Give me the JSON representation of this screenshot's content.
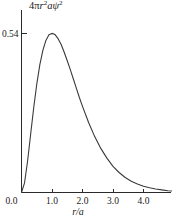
{
  "chart_data": {
    "type": "line",
    "title": "",
    "subtitle": "",
    "ylabel": "4πr²aψ²",
    "ylabel_parts": {
      "coefficient": "4",
      "pi": "π",
      "r": "r",
      "r_exp": "2",
      "a": "a",
      "psi": "ψ",
      "psi_exp": "2"
    },
    "xlabel": "r/a",
    "xlabel_parts": {
      "numerator": "r",
      "slash": "/",
      "denominator": "a"
    },
    "xlim": [
      0.0,
      4.95
    ],
    "ylim": [
      0.0,
      0.595
    ],
    "grid": false,
    "legend": null,
    "x_ticks": [
      {
        "value": 0.0,
        "label": "0.0"
      },
      {
        "value": 1.0,
        "label": "1.0"
      },
      {
        "value": 2.0,
        "label": "2.0"
      },
      {
        "value": 3.0,
        "label": "3.0"
      },
      {
        "value": 4.0,
        "label": "4.0"
      }
    ],
    "y_ticks": [
      {
        "value": 0.0,
        "label": "0.0"
      },
      {
        "value": 0.5413,
        "label": "0.54"
      }
    ],
    "series": [
      {
        "name": "radial probability density",
        "function": "4x^2 e^(-2x)",
        "color": "#3a3a3a",
        "peak": {
          "x": 1.0,
          "y": 0.5413
        },
        "x": [
          0.0,
          0.1,
          0.2,
          0.3,
          0.4,
          0.5,
          0.6,
          0.7,
          0.8,
          0.9,
          1.0,
          1.1,
          1.2,
          1.3,
          1.4,
          1.5,
          1.6,
          1.7,
          1.8,
          1.9,
          2.0,
          2.2,
          2.4,
          2.6,
          2.8,
          3.0,
          3.2,
          3.4,
          3.6,
          3.8,
          4.0,
          4.2,
          4.4,
          4.6,
          4.8,
          4.95
        ],
        "y": [
          0.0,
          0.033,
          0.107,
          0.198,
          0.288,
          0.368,
          0.434,
          0.483,
          0.517,
          0.536,
          0.541,
          0.537,
          0.523,
          0.503,
          0.477,
          0.448,
          0.418,
          0.386,
          0.354,
          0.322,
          0.293,
          0.238,
          0.19,
          0.15,
          0.117,
          0.089,
          0.068,
          0.051,
          0.038,
          0.029,
          0.021,
          0.016,
          0.012,
          0.009,
          0.006,
          0.005
        ]
      }
    ]
  },
  "figure": {
    "background_color": "#ffffff",
    "axis_color": "#2b2b2b",
    "curve_color": "#3a3a3a"
  }
}
